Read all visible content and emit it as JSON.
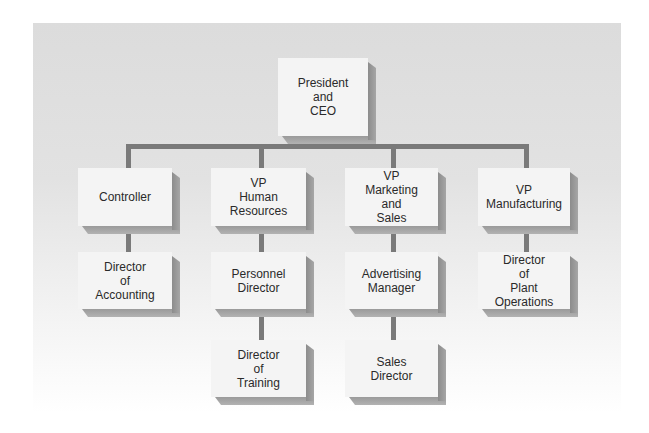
{
  "chart": {
    "nodes": {
      "ceo": {
        "label": "President\nand\nCEO"
      },
      "controller": {
        "label": "Controller"
      },
      "vp_hr": {
        "label": "VP\nHuman\nResources"
      },
      "vp_marketing": {
        "label": "VP\nMarketing\nand\nSales"
      },
      "vp_manufacturing": {
        "label": "VP\nManufacturing"
      },
      "dir_accounting": {
        "label": "Director\nof\nAccounting"
      },
      "personnel_director": {
        "label": "Personnel\nDirector"
      },
      "advertising_manager": {
        "label": "Advertising\nManager"
      },
      "dir_plant_ops": {
        "label": "Director\nof\nPlant\nOperations"
      },
      "dir_training": {
        "label": "Director\nof\nTraining"
      },
      "sales_director": {
        "label": "Sales\nDirector"
      }
    },
    "edges": [
      [
        "ceo",
        "controller"
      ],
      [
        "ceo",
        "vp_hr"
      ],
      [
        "ceo",
        "vp_marketing"
      ],
      [
        "ceo",
        "vp_manufacturing"
      ],
      [
        "controller",
        "dir_accounting"
      ],
      [
        "vp_hr",
        "personnel_director"
      ],
      [
        "personnel_director",
        "dir_training"
      ],
      [
        "vp_marketing",
        "advertising_manager"
      ],
      [
        "advertising_manager",
        "sales_director"
      ],
      [
        "vp_manufacturing",
        "dir_plant_ops"
      ]
    ],
    "colors": {
      "background": "#dcdcdc",
      "box_face": "#f4f4f4",
      "box_side": "#8c8c8c",
      "connector": "#7a7a7a",
      "text": "#2a2a2a"
    }
  }
}
